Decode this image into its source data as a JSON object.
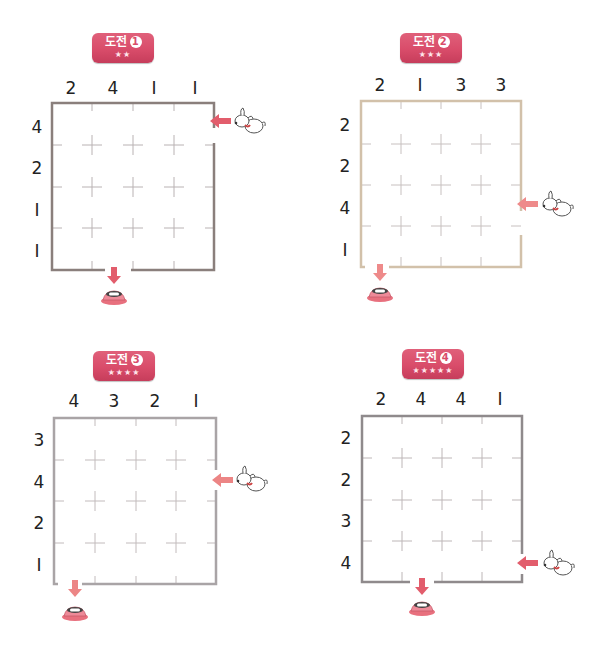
{
  "puzzles": [
    {
      "badge": {
        "label": "도전",
        "number": "1",
        "stars": "★★"
      },
      "columns": [
        "2",
        "4",
        "I",
        "I"
      ],
      "rows": [
        "4",
        "2",
        "I",
        "I"
      ],
      "entry": {
        "side": "right",
        "row": 1
      },
      "exit": {
        "side": "bottom",
        "col": 2
      },
      "border_color": "#8a7f7c"
    },
    {
      "badge": {
        "label": "도전",
        "number": "2",
        "stars": "★★★"
      },
      "columns": [
        "2",
        "I",
        "3",
        "3"
      ],
      "rows": [
        "2",
        "2",
        "4",
        "I"
      ],
      "entry": {
        "side": "right",
        "row": 3
      },
      "exit": {
        "side": "bottom",
        "col": 1
      },
      "border_color": "#c9b8a0"
    },
    {
      "badge": {
        "label": "도전",
        "number": "3",
        "stars": "★★★★"
      },
      "columns": [
        "4",
        "3",
        "2",
        "I"
      ],
      "rows": [
        "3",
        "4",
        "2",
        "I"
      ],
      "entry": {
        "side": "right",
        "row": 2
      },
      "exit": {
        "side": "bottom",
        "col": 1
      },
      "border_color": "#a9a4a6"
    },
    {
      "badge": {
        "label": "도전",
        "number": "4",
        "stars": "★★★★★"
      },
      "columns": [
        "2",
        "4",
        "4",
        "I"
      ],
      "rows": [
        "2",
        "2",
        "3",
        "4"
      ],
      "entry": {
        "side": "right",
        "row": 4
      },
      "exit": {
        "side": "bottom",
        "col": 2
      },
      "border_color": "#8f8a8c"
    }
  ],
  "colors": {
    "badge": "#d94c6a",
    "arrow": "#e06a6a",
    "grid_marks": "#b8b0b0"
  }
}
